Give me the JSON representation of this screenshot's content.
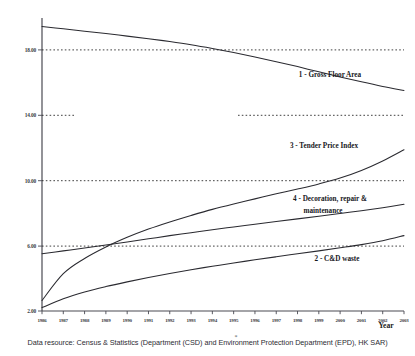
{
  "chart_data": {
    "type": "line",
    "title": "",
    "subtitle": "",
    "xlabel": "Year",
    "ylabel": "",
    "grid": true,
    "legend_position": "inline-right",
    "xlim": [
      1986,
      2003
    ],
    "ylim": [
      2.0,
      19.3
    ],
    "x": [
      1986,
      1987,
      1988,
      1989,
      1990,
      1991,
      1992,
      1993,
      1994,
      1995,
      1996,
      1997,
      1998,
      1999,
      2000,
      2001,
      2002,
      2003
    ],
    "xtick_labels": [
      "1986",
      "1987",
      "1988",
      "1989",
      "1990",
      "1991",
      "1992",
      "1993",
      "1994",
      "1995",
      "1996",
      "1997",
      "1998",
      "1999",
      "2000",
      "2001",
      "2002",
      "2003"
    ],
    "ytick_values": [
      2.0,
      6.0,
      10.0,
      14.0,
      18.0
    ],
    "ytick_labels": [
      "2.00",
      "6.00",
      "10.00",
      "14.00",
      "18.00"
    ],
    "gridlines_at": [
      6.0,
      10.0,
      14.0,
      18.0
    ],
    "series": [
      {
        "key": "gross_floor_area",
        "name": "1 - Gross Floor Area",
        "label_number": "1",
        "values": [
          18.8,
          18.66,
          18.52,
          18.38,
          18.23,
          18.08,
          17.91,
          17.72,
          17.5,
          17.26,
          17.0,
          16.72,
          16.43,
          16.12,
          15.82,
          15.53,
          15.26,
          15.02
        ]
      },
      {
        "key": "cd_waste",
        "name": "2 - C&D waste",
        "label_number": "2",
        "values": [
          2.2,
          2.72,
          3.12,
          3.44,
          3.72,
          3.98,
          4.22,
          4.44,
          4.64,
          4.84,
          5.02,
          5.2,
          5.38,
          5.55,
          5.73,
          5.92,
          6.15,
          6.45
        ]
      },
      {
        "key": "tender_price_index",
        "name": "3 - Tender Price Index",
        "label_number": "3",
        "values": [
          2.62,
          4.2,
          5.1,
          5.78,
          6.35,
          6.84,
          7.26,
          7.64,
          8.0,
          8.32,
          8.62,
          8.92,
          9.2,
          9.5,
          9.85,
          10.3,
          10.86,
          11.52
        ]
      },
      {
        "key": "decoration_repair_maintenance",
        "name": "4 - Decoration, repair & maintenance",
        "label_number": "4",
        "values": [
          5.38,
          5.55,
          5.72,
          5.9,
          6.08,
          6.26,
          6.45,
          6.62,
          6.8,
          6.96,
          7.12,
          7.28,
          7.44,
          7.6,
          7.76,
          7.92,
          8.1,
          8.3
        ]
      }
    ],
    "series_labels": [
      {
        "key": "gross_floor_area",
        "text": "1 - Gross Floor Area",
        "lines": [
          "1 - Gross Floor Area"
        ]
      },
      {
        "key": "tender_price_index",
        "text": "3 - Tender Price Index",
        "lines": [
          "3 - Tender Price Index"
        ]
      },
      {
        "key": "decoration_repair_maintenance",
        "text": "4 - Decoration, repair & maintenance",
        "lines": [
          "4 - Decoration, repair &",
          "maintenance"
        ]
      },
      {
        "key": "cd_waste",
        "text": "2 - C&D waste",
        "lines": [
          "2 - C&D waste"
        ]
      }
    ],
    "annotations": {
      "asterisk": "*"
    }
  },
  "footnote": {
    "text": "Data resource: Census & Statistics (Department (CSD) and Environment Protection Department (EPD), HK SAR)"
  },
  "axis": {
    "x_title": "Year"
  },
  "labels": {
    "gfa": "1 - Gross Floor Area",
    "tpi": "3 - Tender Price Index",
    "drm_line1": "4 - Decoration, repair &",
    "drm_line2": "maintenance",
    "cdw": "2 - C&D waste"
  },
  "yticks": {
    "t18": "18.00",
    "t14": "14.00",
    "t10": "10.00",
    "t6": "6.00",
    "t2": "2.00"
  }
}
